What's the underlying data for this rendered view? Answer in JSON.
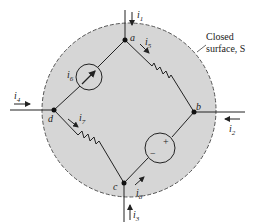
{
  "figure": {
    "surface_label_line1": "Closed",
    "surface_label_line2": "surface, S",
    "nodes": {
      "a": "a",
      "b": "b",
      "c": "c",
      "d": "d"
    },
    "currents": {
      "i1": "i1",
      "i2": "i2",
      "i3": "i3",
      "i4": "i4",
      "i5": "i5",
      "i6": "i6",
      "i7": "i7",
      "i8": "i8"
    },
    "source_signs": {
      "plus": "+",
      "minus": "−"
    },
    "colors": {
      "surface_fill": "#d6d6d6",
      "line": "#222222"
    }
  }
}
